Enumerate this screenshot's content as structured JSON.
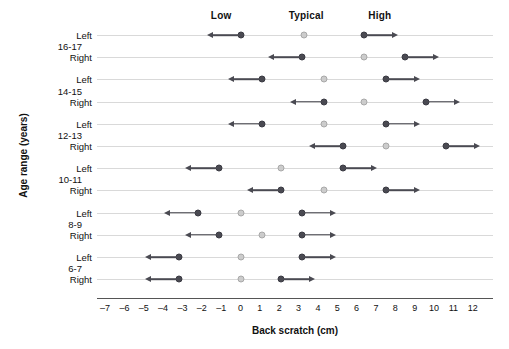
{
  "chart_data": {
    "type": "scatter",
    "title": "",
    "xlabel": "Back scratch (cm)",
    "ylabel": "Age range (years)",
    "xlim": [
      -7,
      12
    ],
    "xticks": [
      -7,
      -6,
      -5,
      -4,
      -3,
      -2,
      -1,
      0,
      1,
      2,
      3,
      4,
      5,
      6,
      7,
      8,
      9,
      10,
      11,
      12
    ],
    "xtick_labels": [
      "–7",
      "–6",
      "–5",
      "–4",
      "–3",
      "–2",
      "–1",
      "0",
      "1",
      "2",
      "3",
      "4",
      "5",
      "6",
      "7",
      "8",
      "9",
      "10",
      "11",
      "12"
    ],
    "grid": true,
    "legend_position": "top",
    "column_headers": [
      {
        "label": "Low",
        "x": -1
      },
      {
        "label": "Typical",
        "x": 3.4
      },
      {
        "label": "High",
        "x": 7.2
      }
    ],
    "marker_styles": {
      "low": {
        "name": "dark-dot-left-arrow",
        "color": "#4a4a52"
      },
      "typical": {
        "name": "light-dot",
        "color": "#cccccc"
      },
      "high": {
        "name": "dark-dot-right-arrow",
        "color": "#4a4a52"
      }
    },
    "groups": [
      {
        "age_range": "16-17",
        "rows": [
          {
            "side": "Left",
            "low": 0.0,
            "typical": 3.3,
            "high": 6.4
          },
          {
            "side": "Right",
            "low": 3.2,
            "typical": 6.4,
            "high": 8.5
          }
        ]
      },
      {
        "age_range": "14-15",
        "rows": [
          {
            "side": "Left",
            "low": 1.1,
            "typical": 4.3,
            "high": 7.5
          },
          {
            "side": "Right",
            "low": 4.3,
            "typical": 6.4,
            "high": 9.6
          }
        ]
      },
      {
        "age_range": "12-13",
        "rows": [
          {
            "side": "Left",
            "low": 1.1,
            "typical": 4.3,
            "high": 7.5
          },
          {
            "side": "Right",
            "low": 5.3,
            "typical": 7.5,
            "high": 10.6
          }
        ]
      },
      {
        "age_range": "10-11",
        "rows": [
          {
            "side": "Left",
            "low": -1.1,
            "typical": 2.1,
            "high": 5.3
          },
          {
            "side": "Right",
            "low": 2.1,
            "typical": 4.3,
            "high": 7.5
          }
        ]
      },
      {
        "age_range": "8-9",
        "rows": [
          {
            "side": "Left",
            "low": -2.2,
            "typical": 0.0,
            "high": 3.2
          },
          {
            "side": "Right",
            "low": -1.1,
            "typical": 1.1,
            "high": 3.2
          }
        ]
      },
      {
        "age_range": "6-7",
        "rows": [
          {
            "side": "Left",
            "low": -3.2,
            "typical": 0.0,
            "high": 3.2
          },
          {
            "side": "Right",
            "low": -3.2,
            "typical": 0.0,
            "high": 2.1
          }
        ]
      }
    ]
  }
}
